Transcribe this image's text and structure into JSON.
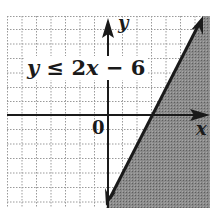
{
  "figure": {
    "inequality": {
      "lhs": "y",
      "operator": "≤",
      "coefficient": "2",
      "var": "x",
      "rest": " − 6",
      "full_text": "y ≤ 2x − 6"
    },
    "axes": {
      "x_label": "x",
      "y_label": "y",
      "origin_label": "0"
    },
    "colors": {
      "shade": "#7a7a7a",
      "line": "#1a1a1a",
      "grid": "#9a9a9a",
      "background": "#ffffff"
    },
    "boundary_line": {
      "equation": "y = 2x - 6",
      "style": "solid",
      "x_intercept": 3,
      "y_intercept": -6
    },
    "shaded_region": "below/right of line (y ≤ 2x − 6)"
  }
}
